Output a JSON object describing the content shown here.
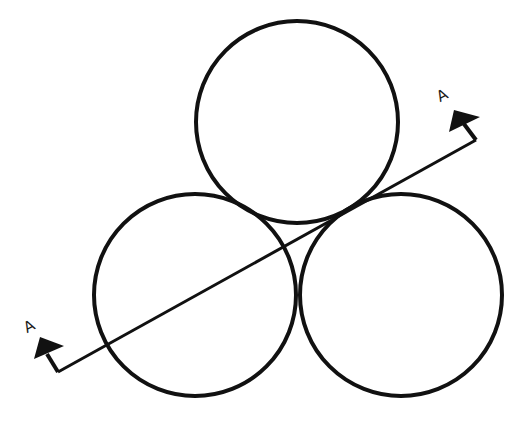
{
  "diagram": {
    "stroke_color": "#111111",
    "background": "#ffffff",
    "circles": [
      {
        "name": "top",
        "cx": 297,
        "cy": 122,
        "r": 101
      },
      {
        "name": "bottom-left",
        "cx": 195,
        "cy": 295,
        "r": 101
      },
      {
        "name": "bottom-right",
        "cx": 401,
        "cy": 295,
        "r": 101
      }
    ],
    "section_line": {
      "x1": 58,
      "y1": 372,
      "x2": 476,
      "y2": 140
    },
    "section_markers": [
      {
        "label": "A",
        "position": "bottom-left"
      },
      {
        "label": "A",
        "position": "top-right"
      }
    ]
  }
}
